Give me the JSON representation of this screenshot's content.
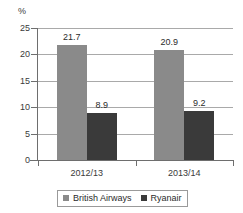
{
  "chart_data": {
    "type": "bar",
    "title": "",
    "subtitle": "",
    "xlabel": "",
    "ylabel": "%",
    "unit_label": "%",
    "categories": [
      "2012/13",
      "2013/14"
    ],
    "series": [
      {
        "name": "British Airways",
        "values": [
          21.7,
          20.9
        ],
        "color": "#8a8a8a"
      },
      {
        "name": "Ryanair",
        "values": [
          8.9,
          9.2
        ],
        "color": "#3a3a3a"
      }
    ],
    "value_labels": [
      [
        "21.7",
        "20.9"
      ],
      [
        "8.9",
        "9.2"
      ]
    ],
    "ylim": [
      0,
      25
    ],
    "ytick_step": 5,
    "yticks": [
      0,
      5,
      10,
      15,
      20,
      25
    ],
    "ytick_labels": [
      "0",
      "5",
      "10",
      "15",
      "20",
      "25"
    ],
    "grid": true,
    "grid_axis": "y",
    "legend_position": "bottom",
    "legend_entries": [
      "British Airways",
      "Ryanair"
    ],
    "background_color": "#ffffff",
    "axis_color": "#6e6e6e",
    "grid_color": "#a9a9a9"
  }
}
